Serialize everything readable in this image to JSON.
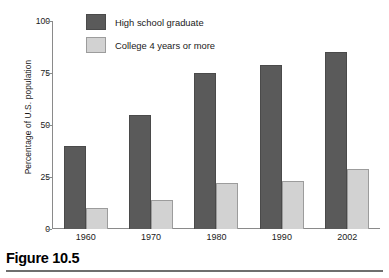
{
  "figure": {
    "caption": "Figure 10.5"
  },
  "chart_data": {
    "type": "bar",
    "title": "",
    "xlabel": "",
    "ylabel": "Percentage of U.S. population",
    "categories": [
      "1960",
      "1970",
      "1980",
      "1990",
      "2002"
    ],
    "series": [
      {
        "name": "High school graduate",
        "color": "#5a5a5a",
        "values": [
          40,
          55,
          75,
          79,
          85
        ]
      },
      {
        "name": "College 4 years or more",
        "color": "#d2d2d2",
        "values": [
          10,
          14,
          22,
          23,
          29
        ]
      }
    ],
    "ylim": [
      0,
      100
    ],
    "yticks": [
      "0",
      "25",
      "50",
      "75",
      "100"
    ],
    "grid": false,
    "legend_position": "top-left-inside"
  },
  "axis": {
    "color": "#8a8a8a"
  }
}
